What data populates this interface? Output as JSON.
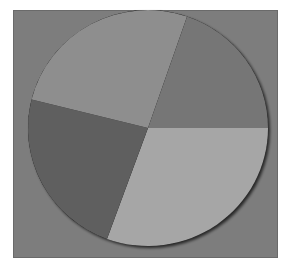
{
  "chart_data": {
    "type": "pie",
    "title": "",
    "legend": [],
    "labels_visible": false,
    "slices": [
      {
        "name": "slice-1",
        "start_deg": 0,
        "end_deg": 110,
        "percent": 30.6,
        "color": "#a6a6a6"
      },
      {
        "name": "slice-2",
        "start_deg": 110,
        "end_deg": 194,
        "percent": 23.3,
        "color": "#5f5f5f"
      },
      {
        "name": "slice-3",
        "start_deg": 194,
        "end_deg": 289,
        "percent": 26.4,
        "color": "#8e8e8e"
      },
      {
        "name": "slice-4",
        "start_deg": 289,
        "end_deg": 360,
        "percent": 19.7,
        "color": "#767676"
      }
    ],
    "values": [
      30.6,
      23.3,
      26.4,
      19.7
    ],
    "background_color": "#7d7d7d",
    "center": [
      148,
      128
    ],
    "radius": [
      120,
      118
    ]
  }
}
